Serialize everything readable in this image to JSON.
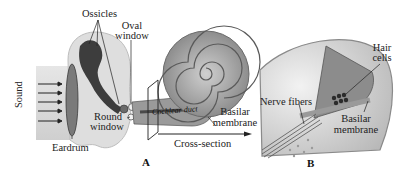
{
  "diagram": {
    "type": "anatomical illustration",
    "panels": [
      {
        "id": "A",
        "label": "A",
        "labels": {
          "sound": "Sound",
          "ossicles": "Ossicles",
          "oval_window_1": "Oval",
          "oval_window_2": "window",
          "round_window_1": "Round",
          "round_window_2": "window",
          "eardrum": "Eardrum",
          "cochlear_duct": "Cochlear duct",
          "basilar_1": "Basilar",
          "basilar_2": "membrane",
          "cross_section": "Cross-section"
        }
      },
      {
        "id": "B",
        "label": "B",
        "labels": {
          "hair_1": "Hair",
          "hair_2": "cells",
          "nerve_fibers": "Nerve fibers",
          "basilar_1": "Basilar",
          "basilar_2": "membrane"
        }
      }
    ],
    "sound_arrows": 5,
    "colors": {
      "tissue_light": "#d9d9d9",
      "tissue_mid": "#a8a8a8",
      "tissue_dark": "#3a3a3a",
      "line": "#222222"
    }
  }
}
